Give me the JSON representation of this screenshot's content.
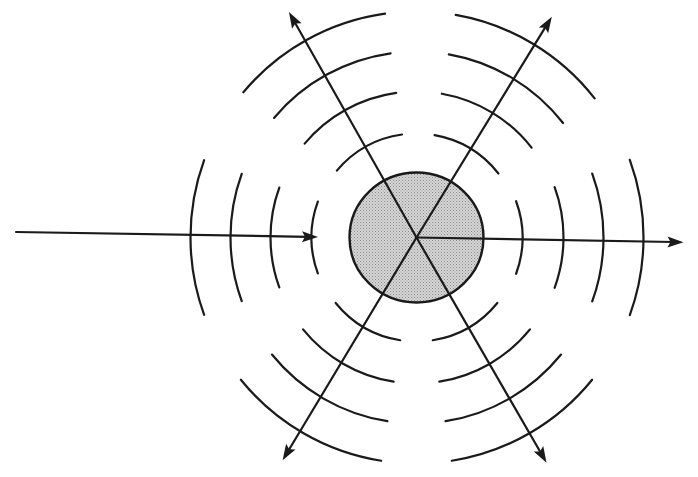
{
  "diagram": {
    "canvas": {
      "width": 698,
      "height": 477,
      "background": "#ffffff"
    },
    "colors": {
      "stroke": "#1a1a1a",
      "scatterer_fill": "#cfcfcf",
      "stipple_dot": "#8a8a8a"
    },
    "scatterer": {
      "label": "scattering particle",
      "cx": 416.5,
      "cy": 237.5,
      "rx": 67,
      "ry": 65
    },
    "incident_ray": {
      "label": "incident wave",
      "x1": 16,
      "y1": 232,
      "x2": 318,
      "y2": 237
    },
    "incident_wavefronts": {
      "label": "incident wavefronts",
      "center_angle_deg": 180,
      "half_span_deg": 20,
      "radii": [
        105,
        146,
        186,
        226
      ]
    },
    "scattered_rays": [
      {
        "label": "forward scattered ray",
        "angle_deg": 1,
        "length": 267
      },
      {
        "label": "scattered ray upper-right",
        "angle_deg": 301.5,
        "length": 259
      },
      {
        "label": "scattered ray upper-left",
        "angle_deg": 240.5,
        "length": 259
      },
      {
        "label": "scattered ray lower-left",
        "angle_deg": 121,
        "length": 260
      },
      {
        "label": "scattered ray lower-right",
        "angle_deg": 60,
        "length": 260
      }
    ],
    "scattered_wavefront_groups": [
      {
        "label": "forward scattered wavefronts",
        "center_angle_deg": 0,
        "half_span_deg": 20,
        "radii": [
          106,
          147,
          187,
          227
        ]
      },
      {
        "label": "upper-right scattered wavefronts",
        "center_angle_deg": 301,
        "half_span_deg": 21,
        "radii": [
          104,
          146,
          186,
          226
        ]
      },
      {
        "label": "upper-left scattered wavefronts",
        "center_angle_deg": 241,
        "half_span_deg": 21,
        "radii": [
          104,
          146,
          186,
          226
        ]
      },
      {
        "label": "lower-left scattered wavefronts",
        "center_angle_deg": 120,
        "half_span_deg": 21,
        "radii": [
          104,
          146,
          186,
          226
        ]
      },
      {
        "label": "lower-right scattered wavefronts",
        "center_angle_deg": 60,
        "half_span_deg": 21,
        "radii": [
          104,
          146,
          186,
          226
        ]
      }
    ]
  }
}
